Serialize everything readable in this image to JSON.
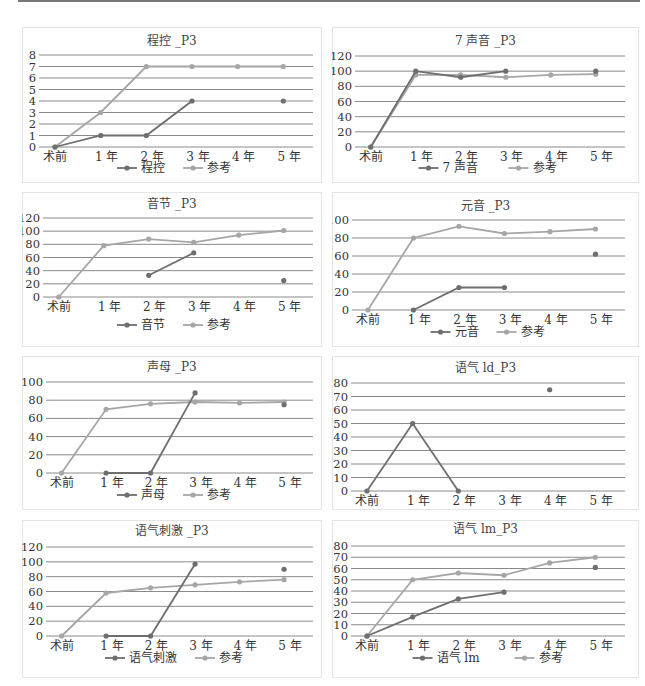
{
  "colors": {
    "main": "#6e6e6e",
    "ref": "#a6a6a6",
    "grid": "#8a8a8a"
  },
  "chart_data": [
    {
      "id": "c1",
      "type": "line",
      "title": "程控 _P3",
      "categories": [
        "术前",
        "1 年",
        "2 年",
        "3 年",
        "4 年",
        "5 年"
      ],
      "ylim": [
        0,
        8
      ],
      "yticks": [
        0,
        1,
        2,
        3,
        4,
        5,
        6,
        7,
        8
      ],
      "series": [
        {
          "name": "程控",
          "values": [
            0,
            1,
            1,
            4,
            null,
            4
          ]
        },
        {
          "name": "参考",
          "values": [
            0,
            3,
            7,
            7,
            7,
            7
          ]
        }
      ],
      "legend_position": "bottom",
      "grid": true
    },
    {
      "id": "c2",
      "type": "line",
      "title": "7 声音 _P3",
      "categories": [
        "术前",
        "1 年",
        "2 年",
        "3 年",
        "4 年",
        "5 年"
      ],
      "ylim": [
        0,
        120
      ],
      "yticks": [
        0,
        20,
        40,
        60,
        80,
        100,
        120
      ],
      "series": [
        {
          "name": "7 声音",
          "values": [
            0,
            100,
            92,
            100,
            null,
            100
          ]
        },
        {
          "name": "参考",
          "values": [
            0,
            95,
            95,
            92,
            95,
            96
          ]
        }
      ],
      "legend_position": "bottom",
      "grid": true
    },
    {
      "id": "c3",
      "type": "line",
      "title": "音节 _P3",
      "categories": [
        "术前",
        "1 年",
        "2 年",
        "3 年",
        "4 年",
        "5 年"
      ],
      "ylim": [
        0,
        120
      ],
      "yticks": [
        0,
        20,
        40,
        60,
        80,
        100,
        120
      ],
      "series": [
        {
          "name": "音节",
          "values": [
            null,
            null,
            33,
            67,
            null,
            25
          ]
        },
        {
          "name": "参考",
          "values": [
            0,
            78,
            88,
            83,
            94,
            101
          ]
        }
      ],
      "legend_position": "bottom",
      "grid": true
    },
    {
      "id": "c4",
      "type": "line",
      "title": "元音 _P3",
      "categories": [
        "术前",
        "1 年",
        "2 年",
        "3 年",
        "4 年",
        "5 年"
      ],
      "ylim": [
        0,
        100
      ],
      "yticks": [
        0,
        20,
        40,
        60,
        80,
        100
      ],
      "series": [
        {
          "name": "元音",
          "values": [
            null,
            0,
            25,
            25,
            null,
            62
          ]
        },
        {
          "name": "参考",
          "values": [
            0,
            80,
            93,
            85,
            87,
            90
          ]
        }
      ],
      "legend_position": "bottom",
      "grid": true
    },
    {
      "id": "c5",
      "type": "line",
      "title": "声母 _P3",
      "categories": [
        "术前",
        "1 年",
        "2 年",
        "3 年",
        "4 年",
        "5 年"
      ],
      "ylim": [
        0,
        100
      ],
      "yticks": [
        0,
        20,
        40,
        60,
        80,
        100
      ],
      "series": [
        {
          "name": "声母",
          "values": [
            null,
            0,
            0,
            88,
            null,
            75
          ]
        },
        {
          "name": "参考",
          "values": [
            0,
            70,
            76,
            78,
            77,
            78
          ]
        }
      ],
      "legend_position": "bottom",
      "grid": true
    },
    {
      "id": "c6",
      "type": "line",
      "title": "语气 ld_P3",
      "categories": [
        "术前",
        "1 年",
        "2 年",
        "3 年",
        "4 年",
        "5 年"
      ],
      "ylim": [
        0,
        80
      ],
      "yticks": [
        0,
        10,
        20,
        30,
        40,
        50,
        60,
        70,
        80
      ],
      "series": [
        {
          "name": "语气 ld",
          "values": [
            0,
            50,
            0,
            null,
            75,
            null
          ]
        }
      ],
      "legend_position": "none",
      "grid": true
    },
    {
      "id": "c7",
      "type": "line",
      "title": "语气刺激 _P3",
      "categories": [
        "术前",
        "1 年",
        "2 年",
        "3 年",
        "4 年",
        "5 年"
      ],
      "ylim": [
        0,
        120
      ],
      "yticks": [
        0,
        20,
        40,
        60,
        80,
        100,
        120
      ],
      "series": [
        {
          "name": "语气刺激",
          "values": [
            null,
            0,
            0,
            97,
            null,
            90
          ]
        },
        {
          "name": "参考",
          "values": [
            0,
            58,
            65,
            69,
            73,
            76
          ]
        }
      ],
      "legend_position": "bottom",
      "grid": true
    },
    {
      "id": "c8",
      "type": "line",
      "title": "语气 lm_P3",
      "categories": [
        "术前",
        "1 年",
        "2 年",
        "3 年",
        "4 年",
        "5 年"
      ],
      "ylim": [
        0,
        80
      ],
      "yticks": [
        0,
        10,
        20,
        30,
        40,
        50,
        60,
        70,
        80
      ],
      "series": [
        {
          "name": "语气 lm",
          "values": [
            0,
            17,
            33,
            39,
            null,
            61
          ]
        },
        {
          "name": "参考",
          "values": [
            0,
            50,
            56,
            54,
            65,
            70
          ]
        }
      ],
      "legend_position": "bottom",
      "grid": true
    }
  ],
  "layout": [
    {
      "id": "c1",
      "box": [
        22,
        27,
        300,
        156
      ],
      "plot": [
        39,
        55,
        313,
        147
      ],
      "legend_y": 172,
      "title_y": 45
    },
    {
      "id": "c2",
      "box": [
        332,
        27,
        307,
        156
      ],
      "plot": [
        355,
        56,
        625,
        147
      ],
      "legend_y": 172,
      "title_y": 45
    },
    {
      "id": "c3",
      "box": [
        22,
        192,
        300,
        155
      ],
      "plot": [
        43,
        218,
        313,
        297
      ],
      "legend_y": 329,
      "title_y": 208
    },
    {
      "id": "c4",
      "box": [
        332,
        192,
        307,
        155
      ],
      "plot": [
        352,
        220,
        625,
        310
      ],
      "legend_y": 336,
      "title_y": 210
    },
    {
      "id": "c5",
      "box": [
        22,
        356,
        300,
        154
      ],
      "plot": [
        46,
        382,
        313,
        473
      ],
      "legend_y": 499,
      "title_y": 371
    },
    {
      "id": "c6",
      "box": [
        332,
        356,
        307,
        154
      ],
      "plot": [
        351,
        383,
        625,
        491
      ],
      "legend_y": null,
      "title_y": 372
    },
    {
      "id": "c7",
      "box": [
        22,
        520,
        300,
        158
      ],
      "plot": [
        46,
        547,
        313,
        636
      ],
      "legend_y": 662,
      "title_y": 535
    },
    {
      "id": "c8",
      "box": [
        332,
        520,
        307,
        158
      ],
      "plot": [
        351,
        546,
        625,
        636
      ],
      "legend_y": 662,
      "title_y": 533
    }
  ]
}
